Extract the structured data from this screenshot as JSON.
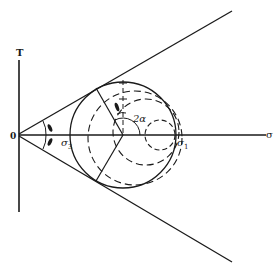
{
  "diagram": {
    "axes": {
      "vertical_label": "T",
      "horizontal_label": "σ",
      "origin_label": "0"
    },
    "labels": {
      "sigma3": "σ",
      "sigma3_sub": "3",
      "sigma1": "σ",
      "sigma1_sub": "1",
      "two_alpha": "2α"
    },
    "colors": {
      "ink": "#1a1a1a",
      "background": "#ffffff"
    }
  }
}
